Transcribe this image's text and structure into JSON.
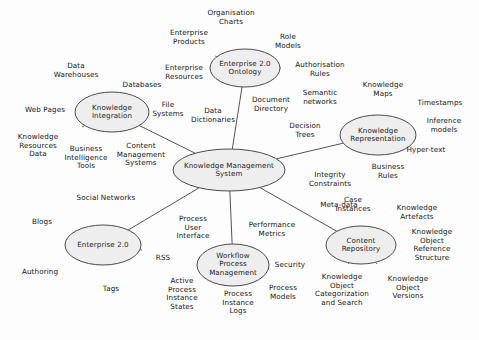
{
  "diagram": {
    "background_color": "#fdfdfd",
    "node_fill": "#eeeeee",
    "node_stroke": "#4a4a4a",
    "edge_color": "#555555",
    "nodes": [
      {
        "id": "kms",
        "label": "Knowledge Management\nSystem",
        "cx": 229,
        "cy": 170,
        "rx": 56,
        "ry": 21
      },
      {
        "id": "ki",
        "label": "Knowledge\nIntegration",
        "cx": 112,
        "cy": 112,
        "rx": 37,
        "ry": 20
      },
      {
        "id": "onto",
        "label": "Enterprise 2.0\nOntology",
        "cx": 245,
        "cy": 68,
        "rx": 35,
        "ry": 19
      },
      {
        "id": "kr",
        "label": "Knowledge\nRepresentation",
        "cx": 378,
        "cy": 135,
        "rx": 38,
        "ry": 20
      },
      {
        "id": "cr",
        "label": "Content\nRepository",
        "cx": 361,
        "cy": 245,
        "rx": 35,
        "ry": 19
      },
      {
        "id": "wpm",
        "label": "Workflow\nProcess\nManagement",
        "cx": 233,
        "cy": 265,
        "rx": 36,
        "ry": 21
      },
      {
        "id": "e20",
        "label": "Enterprise 2.0",
        "cx": 103,
        "cy": 245,
        "rx": 38,
        "ry": 20
      }
    ],
    "hub_links": [
      {
        "from": "kms",
        "to": "ki",
        "label": "Content\nManagement\nSystems",
        "label_x": 141,
        "label_y": 155
      },
      {
        "from": "kms",
        "to": "onto",
        "label": "Data\nDictionaries",
        "label_x": 213,
        "label_y": 116
      },
      {
        "from": "kms",
        "to": "kr",
        "label": "Decision\nTrees",
        "label_x": 305,
        "label_y": 131
      },
      {
        "from": "kms",
        "to": "cr",
        "label": "Meta-data",
        "label_x": 339,
        "label_y": 205
      },
      {
        "from": "kms",
        "to": "wpm",
        "label": "Performance\nMetrics",
        "label_x": 272,
        "label_y": 230
      },
      {
        "from": "kms",
        "to": "e20",
        "label": "Process\nUser\nInterface",
        "label_x": 193,
        "label_y": 228
      }
    ],
    "link_labels": [
      {
        "name": "integrity-constraints-label",
        "text": "Integrity\nConstraints",
        "x": 330,
        "y": 180
      },
      {
        "name": "security-label",
        "text": "Security",
        "x": 290,
        "y": 265
      },
      {
        "name": "document-directory-label",
        "text": "Document\nDirectory",
        "x": 271,
        "y": 105
      },
      {
        "name": "file-systems-label",
        "text": "File\nSystems",
        "x": 168,
        "y": 110
      }
    ],
    "leaves": [
      {
        "hub": "ki",
        "name": "leaf-data-warehouses",
        "text": "Data\nWarehouses",
        "x": 76,
        "y": 71,
        "ax": 92,
        "ay": 96
      },
      {
        "hub": "ki",
        "name": "leaf-databases",
        "text": "Databases",
        "x": 142,
        "y": 85,
        "ax": 124,
        "ay": 95
      },
      {
        "hub": "ki",
        "name": "leaf-web-pages",
        "text": "Web Pages",
        "x": 45,
        "y": 110,
        "ax": 75,
        "ay": 111
      },
      {
        "hub": "ki",
        "name": "leaf-knowledge-resources",
        "text": "Knowledge\nResources\nData",
        "x": 38,
        "y": 146,
        "ax": 82,
        "ay": 127
      },
      {
        "hub": "ki",
        "name": "leaf-business-intelligence",
        "text": "Business\nIntelligence\nTools",
        "x": 86,
        "y": 158,
        "ax": 103,
        "ay": 132
      },
      {
        "hub": "onto",
        "name": "leaf-organisation-charts",
        "text": "Organisation\nCharts",
        "x": 231,
        "y": 18,
        "ax": 239,
        "ay": 49
      },
      {
        "hub": "onto",
        "name": "leaf-enterprise-products",
        "text": "Enterprise\nProducts",
        "x": 189,
        "y": 38,
        "ax": 215,
        "ay": 56
      },
      {
        "hub": "onto",
        "name": "leaf-enterprise-resources",
        "text": "Enterprise\nResources",
        "x": 184,
        "y": 73,
        "ax": 210,
        "ay": 70
      },
      {
        "hub": "onto",
        "name": "leaf-role-models",
        "text": "Role\nModels",
        "x": 288,
        "y": 42,
        "ax": 268,
        "ay": 56
      },
      {
        "hub": "onto",
        "name": "leaf-authorisation-rules",
        "text": "Authorisation\nRules",
        "x": 320,
        "y": 70,
        "ax": 281,
        "ay": 68
      },
      {
        "hub": "kr",
        "name": "leaf-semantic-networks",
        "text": "Semantic\nnetworks",
        "x": 320,
        "y": 98,
        "ax": 358,
        "ay": 120
      },
      {
        "hub": "kr",
        "name": "leaf-knowledge-maps",
        "text": "Knowledge\nMaps",
        "x": 383,
        "y": 90,
        "ax": 378,
        "ay": 115
      },
      {
        "hub": "kr",
        "name": "leaf-timestamps",
        "text": "Timestamps",
        "x": 440,
        "y": 103,
        "ax": 405,
        "ay": 125
      },
      {
        "hub": "kr",
        "name": "leaf-inference-models",
        "text": "Inference\nmodels",
        "x": 444,
        "y": 126,
        "ax": 414,
        "ay": 134
      },
      {
        "hub": "kr",
        "name": "leaf-hyper-text",
        "text": "Hyper-text",
        "x": 426,
        "y": 150,
        "ax": 408,
        "ay": 146
      },
      {
        "hub": "kr",
        "name": "leaf-business-rules",
        "text": "Business\nRules",
        "x": 388,
        "y": 172,
        "ax": 383,
        "ay": 155
      },
      {
        "hub": "cr",
        "name": "leaf-case-instances",
        "text": "Case\nInstances",
        "x": 353,
        "y": 205,
        "ax": 357,
        "ay": 226
      },
      {
        "hub": "cr",
        "name": "leaf-knowledge-artefacts",
        "text": "Knowledge\nArtefacts",
        "x": 417,
        "y": 213,
        "ax": 388,
        "ay": 234
      },
      {
        "hub": "cr",
        "name": "leaf-knowledge-object-ref",
        "text": "Knowledge\nObject\nReference\nStructure",
        "x": 432,
        "y": 245,
        "ax": 396,
        "ay": 245
      },
      {
        "hub": "cr",
        "name": "leaf-knowledge-object-versions",
        "text": "Knowledge\nObject\nVersions",
        "x": 408,
        "y": 288,
        "ax": 377,
        "ay": 264
      },
      {
        "hub": "cr",
        "name": "leaf-knowledge-object-categorization",
        "text": "Knowledge\nObject\nCategorization\nand Search",
        "x": 342,
        "y": 290,
        "ax": 348,
        "ay": 264
      },
      {
        "hub": "wpm",
        "name": "leaf-active-process-states",
        "text": "Active\nProcess\nInstance\nStates",
        "x": 182,
        "y": 294,
        "ax": 204,
        "ay": 277
      },
      {
        "hub": "wpm",
        "name": "leaf-process-instance-logs",
        "text": "Process\nInstance\nLogs",
        "x": 238,
        "y": 303,
        "ax": 233,
        "ay": 286
      },
      {
        "hub": "wpm",
        "name": "leaf-process-models",
        "text": "Process\nModels",
        "x": 283,
        "y": 293,
        "ax": 262,
        "ay": 278
      },
      {
        "hub": "e20",
        "name": "leaf-social-networks",
        "text": "Social Networks",
        "x": 106,
        "y": 198,
        "ax": 106,
        "ay": 225
      },
      {
        "hub": "e20",
        "name": "leaf-blogs",
        "text": "Blogs",
        "x": 42,
        "y": 222,
        "ax": 73,
        "ay": 234
      },
      {
        "hub": "e20",
        "name": "leaf-authoring",
        "text": "Authoring",
        "x": 40,
        "y": 272,
        "ax": 74,
        "ay": 256
      },
      {
        "hub": "e20",
        "name": "leaf-tags",
        "text": "Tags",
        "x": 111,
        "y": 289,
        "ax": 108,
        "ay": 265
      },
      {
        "hub": "e20",
        "name": "leaf-rss",
        "text": "RSS",
        "x": 163,
        "y": 258,
        "ax": 142,
        "ay": 250
      }
    ]
  }
}
